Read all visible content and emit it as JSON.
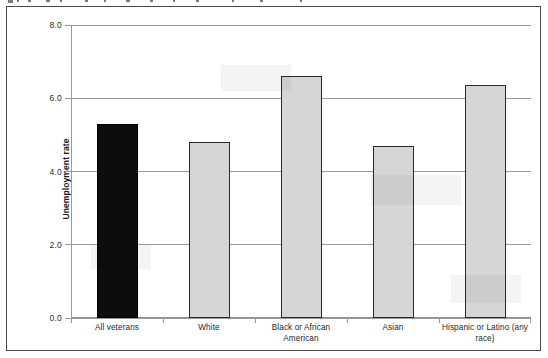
{
  "figure": {
    "frame_border_color": "#4a4a4a",
    "background_color": "#ffffff"
  },
  "chart_data": {
    "type": "bar",
    "title": "",
    "subtitle": "",
    "xlabel": "",
    "ylabel": "Unemployment rate",
    "ylim": [
      0.0,
      8.0
    ],
    "yticks": [
      "0.0",
      "2.0",
      "4.0",
      "6.0",
      "8.0"
    ],
    "ytick_values": [
      0.0,
      2.0,
      4.0,
      6.0,
      8.0
    ],
    "grid": "horizontal",
    "legend": "none",
    "legend_position": "none",
    "categories": [
      "All veterans",
      "White",
      "Black or African American",
      "Asian",
      "Hispanic or Latino (any race)"
    ],
    "values": [
      5.3,
      4.8,
      6.6,
      4.7,
      6.35
    ],
    "bar_colors": [
      "#0d0d0d",
      "#d6d6d6",
      "#d6d6d6",
      "#d6d6d6",
      "#d6d6d6"
    ],
    "bar_edge_color": "#1f1f1f",
    "highlight_category": "All veterans",
    "annotations": []
  }
}
